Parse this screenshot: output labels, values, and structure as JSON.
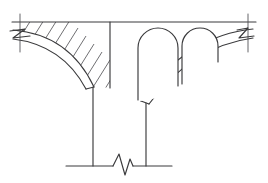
{
  "figure": {
    "title": "Masonry arch bridge pier elevation",
    "background_color": "#ffffff",
    "line_color": "#3a3a3c",
    "hatch_color": "#4a4a4e"
  },
  "elements": {
    "deck_line": {
      "name": "deck-line",
      "kind": "horizontal-line",
      "x1": 12,
      "x2": 256,
      "y": 22
    },
    "left_edge_tick": {
      "name": "left-edge-tick",
      "kind": "vertical-tick",
      "x": 20,
      "y1": 14,
      "y2": 52
    },
    "right_edge_tick": {
      "name": "right-edge-tick",
      "kind": "vertical-tick",
      "x": 248,
      "y1": 14,
      "y2": 52
    },
    "left_break_symbol": {
      "name": "left-break-symbol",
      "kind": "zigzag-break",
      "points": "12,32 24,30 14,38 28,36"
    },
    "right_break_symbol": {
      "name": "right-break-symbol",
      "kind": "zigzag-break",
      "points": "236,31 247,29 238,38 252,36"
    },
    "left_arch_ring": {
      "name": "left-arch-ring",
      "kind": "arch-band",
      "extrados": "M 14,31 C 50,34 76,52 92,86",
      "intrados": "M 14,39 C 46,43 70,60 86,88",
      "springing_y": 88,
      "crown_x": 14
    },
    "right_arch_ring": {
      "name": "right-arch-ring",
      "kind": "arch-band",
      "extrados": "M 252,30 C 212,34 172,56 140,100",
      "intrados": "M 252,39 C 214,44 178,64 147,103",
      "springing_y": 103,
      "crown_x": 252
    },
    "left_pier": {
      "name": "left-pier-line",
      "kind": "vertical-line",
      "x": 93,
      "y1": 86,
      "y2": 165
    },
    "right_pier": {
      "name": "right-pier-line",
      "kind": "vertical-line",
      "x": 146,
      "y1": 103,
      "y2": 165
    },
    "ground_line": {
      "name": "ground-line",
      "kind": "horizontal-line",
      "x1": 66,
      "x2": 172,
      "y": 166
    },
    "ground_break_symbol": {
      "name": "ground-break-symbol",
      "kind": "zigzag-break",
      "points": "114,166 119,155 124,173 129,160 132,166"
    },
    "spandrel_hatch": {
      "name": "spandrel-hatch-region",
      "kind": "diagonal-hatch",
      "line_count": 14,
      "angle_degrees": 58,
      "spacing_px": 7
    },
    "spandrel_right_edge": {
      "name": "spandrel-right-edge",
      "kind": "vertical-line",
      "x": 110,
      "y1": 22,
      "y2": 88
    },
    "arch_openings": [
      {
        "name": "arch-opening-left",
        "kind": "round-headed-opening",
        "x_left": 138,
        "x_right": 178,
        "top_y": 28,
        "bottom_y": 100,
        "arch_radius": 20
      },
      {
        "name": "arch-opening-right",
        "kind": "round-headed-opening",
        "x_left": 182,
        "x_right": 218,
        "top_y": 28,
        "bottom_y": 62,
        "arch_radius": 18
      }
    ]
  }
}
